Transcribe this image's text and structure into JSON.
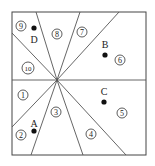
{
  "diagram": {
    "type": "region-partition",
    "frame": {
      "x": 12,
      "y": 12,
      "width": 134,
      "height": 143
    },
    "center": {
      "x": 57,
      "y": 80
    },
    "line_color": "#555555",
    "regions": [
      {
        "id": "1",
        "label": "1",
        "x": 23,
        "y": 95
      },
      {
        "id": "2",
        "label": "2",
        "x": 21,
        "y": 135
      },
      {
        "id": "3",
        "label": "3",
        "x": 56,
        "y": 112
      },
      {
        "id": "4",
        "label": "4",
        "x": 91,
        "y": 134
      },
      {
        "id": "5",
        "label": "5",
        "x": 122,
        "y": 113
      },
      {
        "id": "6",
        "label": "6",
        "x": 120,
        "y": 60
      },
      {
        "id": "7",
        "label": "7",
        "x": 82,
        "y": 32
      },
      {
        "id": "8",
        "label": "8",
        "x": 57,
        "y": 34
      },
      {
        "id": "9",
        "label": "9",
        "x": 21,
        "y": 26
      },
      {
        "id": "10",
        "label": "10",
        "x": 28,
        "y": 68
      }
    ],
    "points": [
      {
        "name": "A",
        "label": "A",
        "x": 34,
        "y": 131,
        "label_x": 34,
        "label_y": 124
      },
      {
        "name": "B",
        "label": "B",
        "x": 105,
        "y": 55,
        "label_x": 105,
        "label_y": 47
      },
      {
        "name": "C",
        "label": "C",
        "x": 104,
        "y": 102,
        "label_x": 104,
        "label_y": 93
      },
      {
        "name": "D",
        "label": "D",
        "x": 34,
        "y": 28,
        "label_x": 34,
        "label_y": 41
      }
    ]
  }
}
